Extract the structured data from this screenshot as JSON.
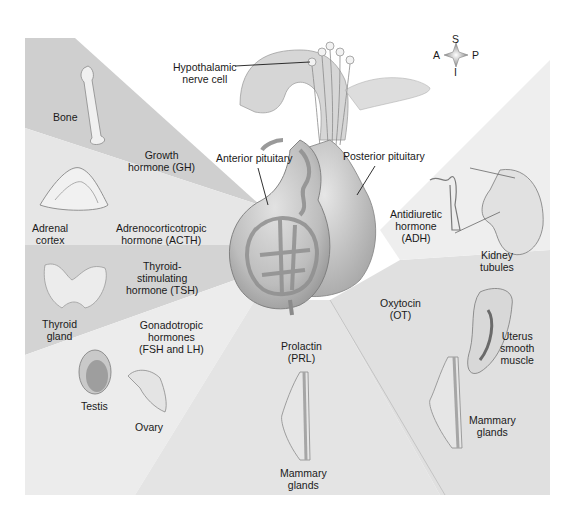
{
  "diagram": {
    "compass": {
      "superior": "S",
      "anterior": "A",
      "posterior": "P",
      "inferior": "I"
    },
    "structures": {
      "hypothalamic_nerve_cell": [
        "Hypothalamic",
        "nerve cell"
      ],
      "anterior_pituitary": "Anterior pituitary",
      "posterior_pituitary": "Posterior pituitary"
    },
    "hormones": [
      {
        "id": "gh",
        "lines": [
          "Growth",
          "hormone (GH)"
        ],
        "source": "Anterior pituitary",
        "targets": [
          [
            "Bone"
          ]
        ]
      },
      {
        "id": "acth",
        "lines": [
          "Adrenocorticotropic",
          "hormone (ACTH)"
        ],
        "source": "Anterior pituitary",
        "targets": [
          [
            "Adrenal",
            "cortex"
          ]
        ]
      },
      {
        "id": "tsh",
        "lines": [
          "Thyroid-",
          "stimulating",
          "hormone (TSH)"
        ],
        "source": "Anterior pituitary",
        "targets": [
          [
            "Thyroid",
            "gland"
          ]
        ]
      },
      {
        "id": "gonadotropic",
        "lines": [
          "Gonadotropic",
          "hormones",
          "(FSH and LH)"
        ],
        "source": "Anterior pituitary",
        "targets": [
          [
            "Testis"
          ],
          [
            "Ovary"
          ]
        ]
      },
      {
        "id": "prl",
        "lines": [
          "Prolactin",
          "(PRL)"
        ],
        "source": "Anterior pituitary",
        "targets": [
          [
            "Mammary",
            "glands"
          ]
        ]
      },
      {
        "id": "ot",
        "lines": [
          "Oxytocin",
          "(OT)"
        ],
        "source": "Posterior pituitary",
        "targets": [
          [
            "Uterus",
            "smooth",
            "muscle"
          ],
          [
            "Mammary",
            "glands"
          ]
        ]
      },
      {
        "id": "adh",
        "lines": [
          "Antidiuretic",
          "hormone",
          "(ADH)"
        ],
        "source": "Posterior pituitary",
        "targets": [
          [
            "Kidney",
            "tubules"
          ]
        ]
      }
    ],
    "colors": {
      "beam_dark": "#cfcfcf",
      "beam_mid": "#dcdcdc",
      "beam_light": "#e9e9e9",
      "gland": "#bdbdbd",
      "vessel": "#8f8f8f",
      "text": "#1a1a1a"
    }
  }
}
